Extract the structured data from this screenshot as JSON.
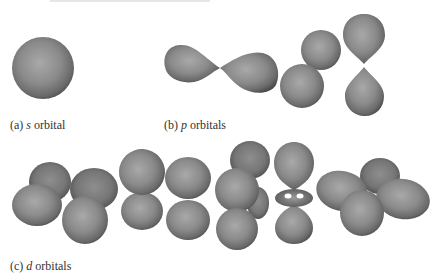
{
  "figure": {
    "subfigures": [
      {
        "id": "a",
        "label": "(a)",
        "symbol": "s",
        "text": "orbital",
        "shapes": [
          "sphere"
        ]
      },
      {
        "id": "b",
        "label": "(b)",
        "symbol": "p",
        "text": "orbitals",
        "shapes": [
          "p-horizontal",
          "p-diagonal",
          "p-vertical"
        ]
      },
      {
        "id": "c",
        "label": "(c)",
        "symbol": "d",
        "text": "orbitals",
        "shapes": [
          "d-cloverleaf-tilted",
          "d-cloverleaf-front",
          "d-cloverleaf-vertical",
          "d-z2-torus",
          "d-cloverleaf-flat"
        ]
      }
    ],
    "colors": {
      "surface_light": "#a8a8a8",
      "surface_mid": "#828282",
      "surface_dark": "#4a4a4a",
      "caption": "#333333",
      "background": "#ffffff"
    }
  }
}
